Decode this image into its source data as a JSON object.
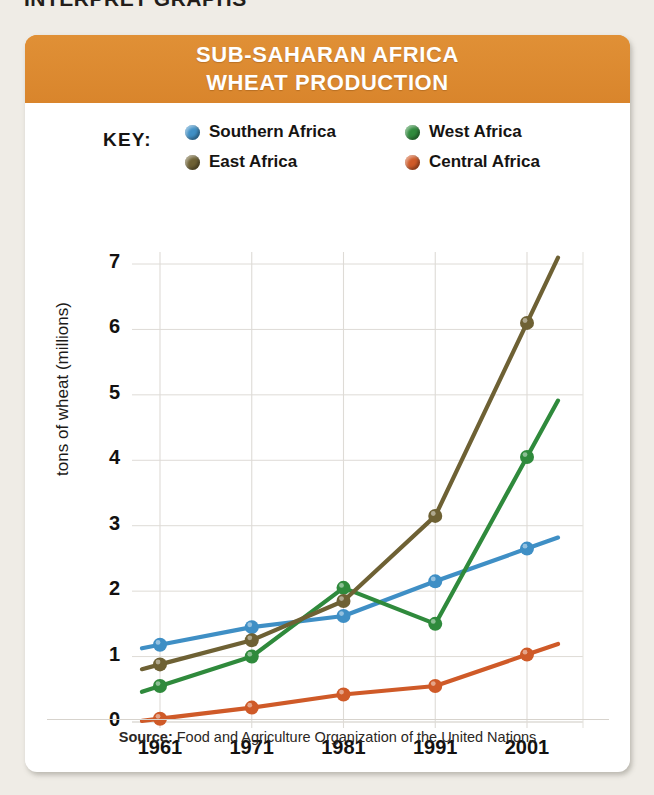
{
  "page_heading": "INTERPRET GRAPHS",
  "card": {
    "title_lines": [
      "SUB-SAHARAN AFRICA",
      "WHEAT PRODUCTION"
    ],
    "header_color": "#dd8b32"
  },
  "legend": {
    "key_label": "KEY:",
    "items": [
      {
        "label": "Southern Africa",
        "color": "#3f8fc5"
      },
      {
        "label": "West Africa",
        "color": "#2f8a3c"
      },
      {
        "label": "East Africa",
        "color": "#6e6134"
      },
      {
        "label": "Central Africa",
        "color": "#cf5a28"
      }
    ]
  },
  "source": {
    "prefix": "Source:",
    "text": " Food and Agriculture Organization of the United Nations"
  },
  "chart_data": {
    "type": "line",
    "title": "SUB-SAHARAN AFRICA WHEAT PRODUCTION",
    "xlabel": "",
    "ylabel": "tons of wheat (millions)",
    "x": [
      1961,
      1971,
      1981,
      1991,
      2001
    ],
    "xticklabels": [
      "1961",
      "1971",
      "1981",
      "1991",
      "2001"
    ],
    "yticks": [
      0,
      1,
      2,
      3,
      4,
      5,
      6,
      7
    ],
    "yticklabels": [
      "0",
      "1",
      "2",
      "3",
      "4",
      "5",
      "6",
      "7"
    ],
    "ylim": [
      0,
      7
    ],
    "xlim": [
      1961,
      2001
    ],
    "grid": true,
    "legend_position": "top",
    "series": [
      {
        "name": "Southern Africa",
        "color": "#3f8fc5",
        "values": [
          1.18,
          1.45,
          1.62,
          2.15,
          2.65
        ]
      },
      {
        "name": "West Africa",
        "color": "#2f8a3c",
        "values": [
          0.55,
          1.0,
          2.05,
          1.5,
          4.05
        ]
      },
      {
        "name": "East Africa",
        "color": "#6e6134",
        "values": [
          0.88,
          1.25,
          1.85,
          3.15,
          6.1
        ]
      },
      {
        "name": "Central Africa",
        "color": "#cf5a28",
        "values": [
          0.05,
          0.22,
          0.42,
          0.55,
          1.03
        ]
      }
    ]
  }
}
